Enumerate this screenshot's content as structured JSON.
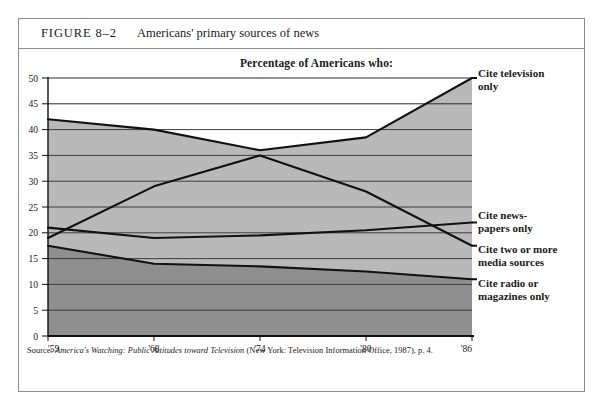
{
  "figure": {
    "number": "FIGURE 8–2",
    "caption": "Americans' primary sources of news"
  },
  "chart_title": "Percentage of Americans who:",
  "source": {
    "prefix": "Source: ",
    "italic_title": "America's Watching: Public Attitudes toward Television",
    "suffix": " (New York: Television Information Office, 1987), p. 4."
  },
  "labels": {
    "television": "Cite television\nonly",
    "newspapers": "Cite news-\npapers only",
    "multiple": "Cite two or more\nmedia sources",
    "radio": "Cite radio or\nmagazines only"
  },
  "colors": {
    "band_upper": "#b9b9b9",
    "band_lower": "#8f8f8f",
    "line": "#111111",
    "axis": "#111111",
    "grid": "#3d3d3d",
    "frame": "#8d8d8d"
  },
  "chart_data": {
    "type": "line",
    "title": "Percentage of Americans who:",
    "xlabel": "",
    "ylabel": "",
    "x": [
      "'59",
      "'68",
      "'74",
      "'80",
      "'86"
    ],
    "ytick_labels": [
      "0",
      "5",
      "10",
      "15",
      "20",
      "25",
      "30",
      "35",
      "40",
      "45",
      "50"
    ],
    "yticks": [
      0,
      5,
      10,
      15,
      20,
      25,
      30,
      35,
      40,
      45,
      50
    ],
    "ylim": [
      0,
      50
    ],
    "grid": true,
    "legend_position": "right-inline",
    "area_fill": true,
    "series": [
      {
        "name": "Cite television only",
        "values": [
          42,
          40,
          36,
          38.5,
          50
        ]
      },
      {
        "name": "Cite two or more media sources",
        "values": [
          19,
          29,
          35,
          28,
          17.5
        ]
      },
      {
        "name": "Cite newspapers only",
        "values": [
          21,
          19,
          19.5,
          20.5,
          22
        ]
      },
      {
        "name": "Cite radio or magazines only",
        "values": [
          17.5,
          14,
          13.5,
          12.5,
          11
        ]
      }
    ]
  }
}
